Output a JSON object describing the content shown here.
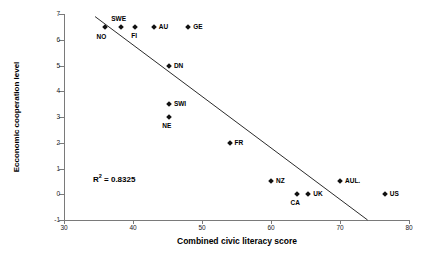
{
  "chart_data": {
    "type": "scatter",
    "title": "",
    "xlabel": "Combined civic literacy score",
    "ylabel": "Ecconomic cooperation level",
    "xlim": [
      30,
      80
    ],
    "ylim": [
      -1,
      7
    ],
    "xticks": [
      "30",
      "40",
      "50",
      "60",
      "70",
      "80"
    ],
    "yticks": [
      "-1",
      "0",
      "1",
      "2",
      "3",
      "4",
      "5",
      "6",
      "7"
    ],
    "grid": false,
    "legend": "none",
    "annotations": [
      {
        "text": "R2 = 0.8325",
        "display": "R",
        "sup": "2",
        "rest": " = 0.8325",
        "x": 34.2,
        "y": 0.82
      }
    ],
    "points": [
      {
        "label": "NO",
        "x": 36.0,
        "y": 6.5,
        "label_dx": -4,
        "label_dy": 10
      },
      {
        "label": "SWE",
        "x": 38.2,
        "y": 6.5,
        "label_dx": -2,
        "label_dy": -8
      },
      {
        "label": "FI",
        "x": 40.3,
        "y": 6.5,
        "label_dx": -1,
        "label_dy": 9
      },
      {
        "label": "AU",
        "x": 43.0,
        "y": 6.5,
        "label_dx": 5,
        "label_dy": 0
      },
      {
        "label": "GE",
        "x": 48.0,
        "y": 6.5,
        "label_dx": 5,
        "label_dy": 0
      },
      {
        "label": "DN",
        "x": 45.2,
        "y": 5.0,
        "label_dx": 5,
        "label_dy": 0
      },
      {
        "label": "SWI",
        "x": 45.2,
        "y": 3.5,
        "label_dx": 5,
        "label_dy": 0
      },
      {
        "label": "NE",
        "x": 45.2,
        "y": 3.0,
        "label_dx": -2,
        "label_dy": 9
      },
      {
        "label": "FR",
        "x": 54.0,
        "y": 2.0,
        "label_dx": 5,
        "label_dy": 0
      },
      {
        "label": "NZ",
        "x": 60.0,
        "y": 0.5,
        "label_dx": 5,
        "label_dy": 0
      },
      {
        "label": "CA",
        "x": 63.8,
        "y": 0.0,
        "label_dx": -2,
        "label_dy": 9
      },
      {
        "label": "UK",
        "x": 65.4,
        "y": 0.0,
        "label_dx": 5,
        "label_dy": 0
      },
      {
        "label": "AUL.",
        "x": 70.0,
        "y": 0.5,
        "label_dx": 5,
        "label_dy": 0
      },
      {
        "label": "US",
        "x": 76.5,
        "y": 0.0,
        "label_dx": 5,
        "label_dy": 0
      }
    ],
    "trendline": {
      "x1": 34.5,
      "y1": 6.9,
      "x2": 74.0,
      "y2": -1.0
    }
  }
}
